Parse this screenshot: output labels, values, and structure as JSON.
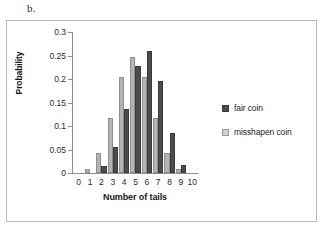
{
  "panel": {
    "letter": "b."
  },
  "chart_data": {
    "type": "bar",
    "title": "",
    "xlabel": "Number of tails",
    "ylabel": "Probability",
    "categories": [
      "0",
      "1",
      "2",
      "3",
      "4",
      "5",
      "6",
      "7",
      "8",
      "9",
      "10"
    ],
    "series": [
      {
        "name": "fair coin",
        "color": "#4C4C4C",
        "values": [
          0,
          0,
          0.015,
          0.056,
          0.136,
          0.227,
          0.26,
          0.195,
          0.086,
          0.017,
          0
        ]
      },
      {
        "name": "misshapen coin",
        "color": "#B4B4B4",
        "values": [
          0,
          0.008,
          0.043,
          0.117,
          0.205,
          0.246,
          0.205,
          0.117,
          0.043,
          0.008,
          0
        ]
      }
    ],
    "ylim": [
      0,
      0.3
    ],
    "yticks": [
      0,
      0.05,
      0.1,
      0.15,
      0.2,
      0.25,
      0.3
    ],
    "ytick_labels": [
      "0",
      "0.05",
      "0.1",
      "0.15",
      "0.2",
      "0.25",
      "0.3"
    ],
    "grid": false,
    "legend_position": "right"
  },
  "legend": {
    "items": [
      {
        "label": "fair coin",
        "swatch": "fair"
      },
      {
        "label": "misshapen coin",
        "swatch": "miss"
      }
    ]
  }
}
